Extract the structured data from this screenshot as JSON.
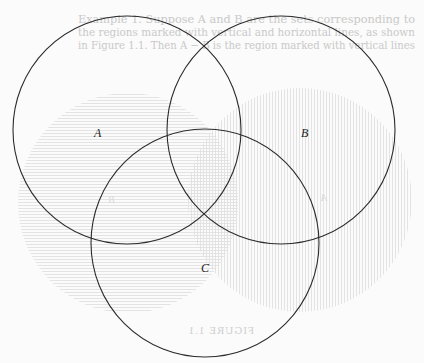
{
  "figure": {
    "type": "venn-diagram",
    "sets": [
      {
        "label": "A",
        "cx": 127,
        "cy": 130,
        "r": 114,
        "label_x": 98,
        "label_y": 137
      },
      {
        "label": "B",
        "cx": 281,
        "cy": 130,
        "r": 114,
        "label_x": 305,
        "label_y": 137
      },
      {
        "label": "C",
        "cx": 205,
        "cy": 243,
        "r": 114,
        "label_x": 205,
        "label_y": 272
      }
    ],
    "stroke_color": "#2b2b2b"
  },
  "bleed_through": {
    "text_lines": [
      "Example 1.  Suppose A and B are the sets corresponding to",
      "the regions marked with vertical and horizontal lines, as shown",
      "in Figure 1.1. Then A − B is the region marked with vertical lines"
    ],
    "faint_labels": [
      "B",
      "A"
    ],
    "caption": "FIGURE 1.1",
    "hatch_color": "#e2e2e2"
  }
}
